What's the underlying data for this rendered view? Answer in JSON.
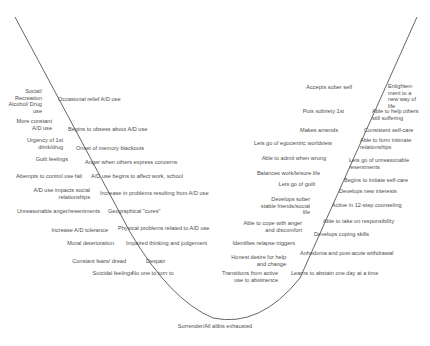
{
  "diagram": {
    "type": "curve",
    "bottom_label": "Surrender/All alibis exhausted",
    "descent_outer": [
      "Social/ Recreation Alcohol/ Drug use",
      "More constant A/D use",
      "Urgency of 1st drink/drug",
      "Guilt feelings",
      "Attempts to control use fail",
      "A/D use impacts social relationships",
      "Unreasonable anger/resentments",
      "Increase A/D tolerance",
      "Moral deterioration",
      "Constant fears/ dread",
      "Suicidal feelings"
    ],
    "descent_inner": [
      "Occasional relief A/D use",
      "Begins to obsess about A/D use",
      "Onset of memory blackouts",
      "Anger when others express concerns",
      "A/D use begins to affect work, school",
      "Increase in problems resulting from A/D use",
      "Geographical \"cures\"",
      "Physical problems related to A/D use",
      "Impaired thinking and judgement",
      "Despair",
      "No one to turn to"
    ],
    "ascent_inner": [
      "Accepts sober self",
      "Puts sobriety 1st",
      "Makes amends",
      "Lets go of egocentric worldview",
      "Able to admit when wrong",
      "Balances work/leisure life",
      "Lets go of guilt",
      "Develops sober stable friends/social life",
      "Able to cope with anger and discomfort",
      "Identifies relapse triggers",
      "Honest desire for help and change",
      "Transitions from active use to abstinence"
    ],
    "ascent_outer": [
      "Enlighten- ment to a new way of life",
      "Able to help others still suffering",
      "Consistent self-care",
      "Able to form intimate relationships",
      "Lets go of unreasonable resentments",
      "Begins to initiate self-care",
      "Develops new interests",
      "Active in 12-step counseling",
      "Able to take on responsibility",
      "Develops coping skills",
      "Anhedonia and post-acute withdrawal",
      "Learns to abstain one day at a time"
    ]
  }
}
